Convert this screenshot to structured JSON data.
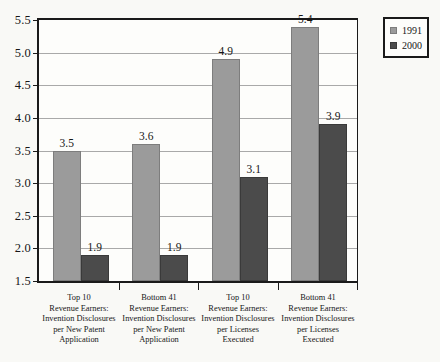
{
  "chart_data": {
    "type": "bar",
    "title": "",
    "subtitle": "",
    "xlabel": "",
    "ylabel": "",
    "ylim": [
      1.5,
      5.5
    ],
    "ytick_labels": [
      "5.5",
      "5.0",
      "4.5",
      "4.0",
      "3.5",
      "3.0",
      "2.5",
      "2.0",
      "1.5"
    ],
    "ytick_values": [
      5.5,
      5.0,
      4.5,
      4.0,
      3.5,
      3.0,
      2.5,
      2.0,
      1.5
    ],
    "grid": "horizontal",
    "legend_position": "top-right",
    "categories": [
      "Top 10 Revenue Earners: Invention Disclosures per New Patent Application",
      "Bottom 41 Revenue Earners: Invention Disclosures per New Patent Application",
      "Top 10 Revenue Earners: Invention Disclosures per Licenses Executed",
      "Bottom 41 Revenue Earners: Invention Disclosures per Licenses Executed"
    ],
    "category_lines": [
      [
        "Top 10",
        "Revenue Earners:",
        "Invention Disclosures",
        "per New Patent",
        "Application"
      ],
      [
        "Bottom 41",
        "Revenue Earners:",
        "Invention Disclosures",
        "per New Patent",
        "Application"
      ],
      [
        "Top 10",
        "Revenue Earners:",
        "Invention Disclosures",
        "per Licenses",
        "Executed"
      ],
      [
        "Bottom 41",
        "Revenue Earners:",
        "Invention Disclosures",
        "per Licenses",
        "Executed"
      ]
    ],
    "series": [
      {
        "name": "1991",
        "color": "#9b9b9b",
        "values": [
          3.5,
          3.6,
          4.9,
          5.4
        ],
        "labels": [
          "3.5",
          "3.6",
          "4.9",
          "5.4"
        ]
      },
      {
        "name": "2000",
        "color": "#4b4b4b",
        "values": [
          1.9,
          1.9,
          3.1,
          3.9
        ],
        "labels": [
          "1.9",
          "1.9",
          "3.1",
          "3.9"
        ]
      }
    ]
  },
  "legend": {
    "entries": [
      {
        "label": "1991",
        "color": "#9b9b9b"
      },
      {
        "label": "2000",
        "color": "#4b4b4b"
      }
    ]
  },
  "colors": {
    "background": "#f9f9f6",
    "plot_background": "#fdfdfb",
    "axis": "#1a1a1a",
    "gridline": "#a9a9a9",
    "series_1991": "#9b9b9b",
    "series_2000": "#4b4b4b",
    "text": "#161616"
  }
}
